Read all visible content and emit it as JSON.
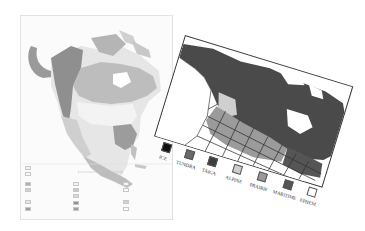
{
  "left_map": {
    "description": "Vegetation map of North America (flat sheet)",
    "colors": {
      "background": "#fbfbfb",
      "land_light": "#e4e4e4",
      "boreal": "#c4c4c4",
      "mountain": "#8f8f8f",
      "tundra": "#a9a9a9",
      "southeast_forest": "#9c9c9c",
      "ice": "#ffffff"
    },
    "legend_note": "Legend text illegible at screenshot resolution"
  },
  "right_map": {
    "description": "Snow-class map of North America (rotated sheet)",
    "colors": {
      "frame": "#3a3a3a",
      "taiga": "#4a4a4a",
      "prairie": "#9b9b9b",
      "alpine": "#cfcfcf",
      "ephemeral": "#ffffff",
      "borders": "#333333"
    },
    "legend": [
      {
        "label": "ICE",
        "color": "#111111"
      },
      {
        "label": "TUNDRA",
        "color": "#6a6a6a"
      },
      {
        "label": "TAIGA",
        "color": "#3e3e3e"
      },
      {
        "label": "ALPINE",
        "color": "#cdcdcd"
      },
      {
        "label": "PRAIRIE",
        "color": "#9a9a9a"
      },
      {
        "label": "MARITIME",
        "color": "#555555"
      },
      {
        "label": "EPHEM.",
        "color": "#ffffff"
      }
    ]
  }
}
